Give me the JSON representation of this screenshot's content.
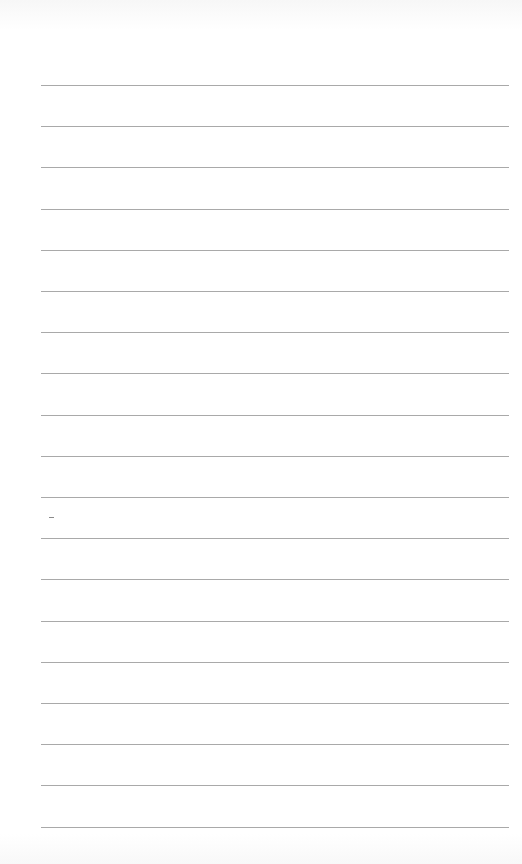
{
  "page": {
    "type": "lined-paper",
    "background_color": "#ffffff",
    "rule_color": "#9a9a9a",
    "rule_count": 19,
    "rule_start_y": 85,
    "rule_spacing": 41.2,
    "rule_left_x": 41,
    "rule_right_x": 509,
    "text": ""
  }
}
